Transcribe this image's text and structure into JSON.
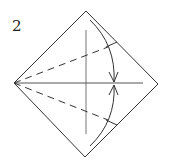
{
  "diagram": {
    "step_number": "2",
    "stroke_color": "#333333",
    "elements": [
      "square-diamond",
      "center-vertical-crease",
      "center-horizontal-crease",
      "dashed-valley-fold-upper",
      "dashed-valley-fold-lower",
      "curved-fold-arrow-upper",
      "curved-fold-arrow-lower"
    ]
  }
}
